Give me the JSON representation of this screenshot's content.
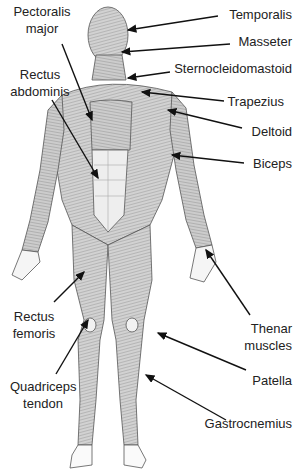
{
  "diagram": {
    "colors": {
      "arrow": "#111111",
      "muscle_fill": "#cfcfcf",
      "muscle_line": "#777777",
      "tendon": "#f2f2f2",
      "text": "#222222"
    },
    "labels_left": [
      {
        "id": "pectoralis-major",
        "lines": [
          "Pectoralis",
          "major"
        ]
      },
      {
        "id": "rectus-abdominis",
        "lines": [
          "Rectus",
          "abdominis"
        ]
      },
      {
        "id": "rectus-femoris",
        "lines": [
          "Rectus",
          "femoris"
        ]
      },
      {
        "id": "quadriceps-tendon",
        "lines": [
          "Quadriceps",
          "tendon"
        ]
      }
    ],
    "labels_right": [
      {
        "id": "temporalis",
        "lines": [
          "Temporalis"
        ]
      },
      {
        "id": "masseter",
        "lines": [
          "Masseter"
        ]
      },
      {
        "id": "sternocleidomastoid",
        "lines": [
          "Sternocleidomastoid"
        ]
      },
      {
        "id": "trapezius",
        "lines": [
          "Trapezius"
        ]
      },
      {
        "id": "deltoid",
        "lines": [
          "Deltoid"
        ]
      },
      {
        "id": "biceps",
        "lines": [
          "Biceps"
        ]
      },
      {
        "id": "thenar-muscles",
        "lines": [
          "Thenar",
          "muscles"
        ]
      },
      {
        "id": "patella",
        "lines": [
          "Patella"
        ]
      },
      {
        "id": "gastrocnemius",
        "lines": [
          "Gastrocnemius"
        ]
      }
    ]
  }
}
